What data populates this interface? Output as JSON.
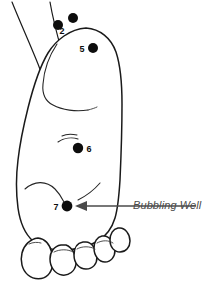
{
  "diagram": {
    "background_color": "#ffffff",
    "outline_color": "#1a1a1a",
    "dot_color": "#0d0d0d",
    "callout_color": "#4a4a4a",
    "points": [
      {
        "id": "point-2",
        "label": "2",
        "label_x": 62,
        "label_y": 34,
        "dots": [
          {
            "cx": 58,
            "cy": 25,
            "r": 5.0
          },
          {
            "cx": 73,
            "cy": 18,
            "r": 5.0
          }
        ]
      },
      {
        "id": "point-5",
        "label": "5",
        "label_x": 82,
        "label_y": 52,
        "dots": [
          {
            "cx": 93,
            "cy": 48,
            "r": 5.0
          }
        ]
      },
      {
        "id": "point-6",
        "label": "6",
        "label_x": 84,
        "label_y": 152,
        "dots": [
          {
            "cx": 78,
            "cy": 148,
            "r": 5.2
          }
        ]
      },
      {
        "id": "point-7",
        "label": "7",
        "label_x": 54,
        "label_y": 210,
        "dots": [
          {
            "cx": 67,
            "cy": 206,
            "r": 5.4
          }
        ]
      }
    ],
    "callout": {
      "label": "Bubbling Well",
      "text_x": 133,
      "text_y": 199,
      "line_from_x": 196,
      "line_to_x": 78,
      "line_y": 206
    }
  }
}
